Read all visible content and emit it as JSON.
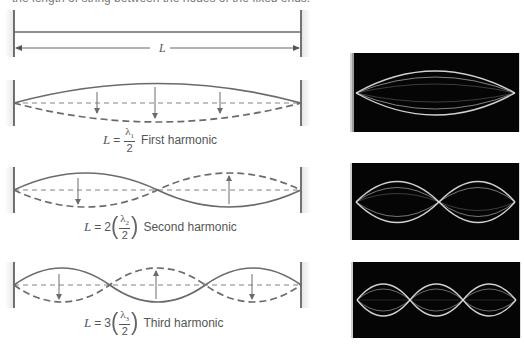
{
  "caption": {
    "top_text": "the length of string between the nodes of the fixed ends."
  },
  "reference": {
    "dimension_label": "L"
  },
  "harmonics": [
    {
      "name": "First harmonic",
      "formula_L": "L",
      "formula_eq": "=",
      "formula_coef": "",
      "lambda_symbol": "λ",
      "lambda_sub": "1",
      "denominator": "2",
      "label": "First harmonic",
      "n": 1
    },
    {
      "name": "Second harmonic",
      "formula_L": "L",
      "formula_eq": "=",
      "formula_coef": "2",
      "lambda_symbol": "λ",
      "lambda_sub": "2",
      "denominator": "2",
      "label": "Second harmonic",
      "n": 2
    },
    {
      "name": "Third harmonic",
      "formula_L": "L",
      "formula_eq": "=",
      "formula_coef": "3",
      "lambda_symbol": "λ",
      "lambda_sub": "3",
      "denominator": "2",
      "label": "Third harmonic",
      "n": 3
    }
  ],
  "photos": [
    {
      "name": "standing-wave-photo-1",
      "loops": 1
    },
    {
      "name": "standing-wave-photo-2",
      "loops": 2
    },
    {
      "name": "standing-wave-photo-3",
      "loops": 3
    }
  ],
  "colors": {
    "string": "#6b6b6b",
    "post": "#444444",
    "photo_bg": "#050505",
    "photo_wave": "#e8e8e8"
  }
}
